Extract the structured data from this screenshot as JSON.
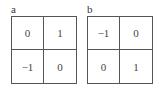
{
  "panels": [
    {
      "label": "a",
      "cells": [
        "0",
        "1",
        "−1",
        "0"
      ]
    },
    {
      "label": "b",
      "cells": [
        "−1",
        "0",
        "0",
        "1"
      ]
    }
  ]
}
